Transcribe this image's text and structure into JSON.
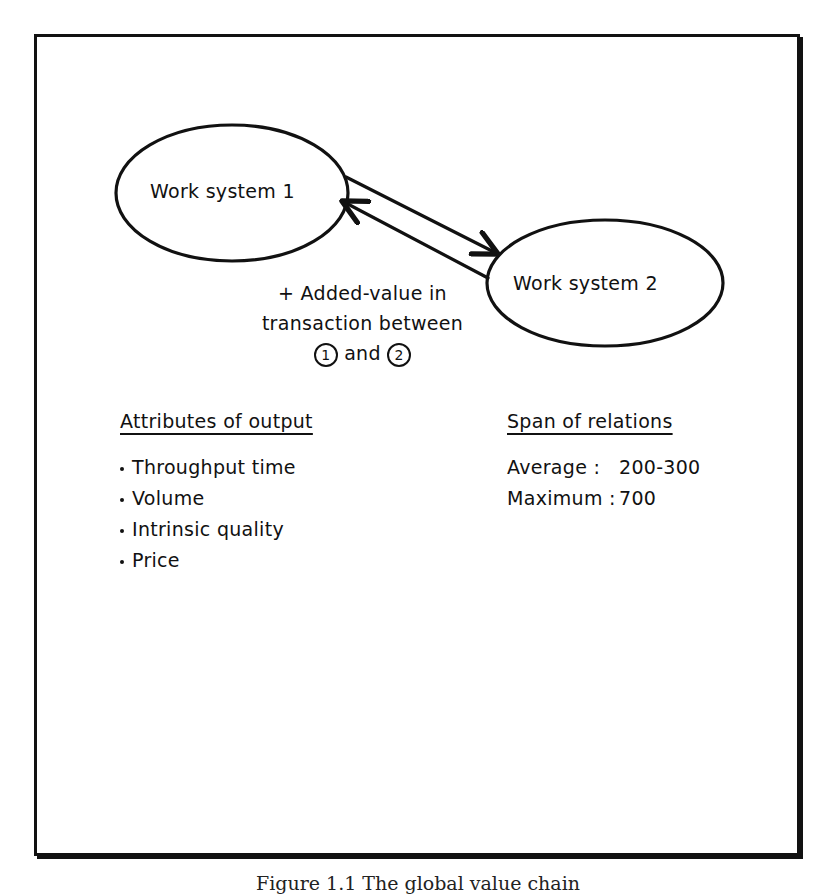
{
  "diagram": {
    "nodes": [
      {
        "id": "ws1",
        "label": "Work system 1"
      },
      {
        "id": "ws2",
        "label": "Work system 2"
      }
    ],
    "edges": [
      {
        "from": "ws1",
        "to": "ws2"
      },
      {
        "from": "ws2",
        "to": "ws1"
      }
    ],
    "annotation": {
      "line1": "+ Added-value in",
      "line2": "transaction between",
      "marker1": "1",
      "and": "and",
      "marker2": "2"
    }
  },
  "attributes": {
    "heading": "Attributes of output",
    "items": [
      "Throughput time",
      "Volume",
      "Intrinsic quality",
      "Price"
    ]
  },
  "span": {
    "heading": "Span of relations",
    "rows": [
      {
        "label": "Average :",
        "value": "200-300"
      },
      {
        "label": "Maximum :",
        "value": "700"
      }
    ]
  },
  "caption": "Figure 1.1 The global value chain"
}
